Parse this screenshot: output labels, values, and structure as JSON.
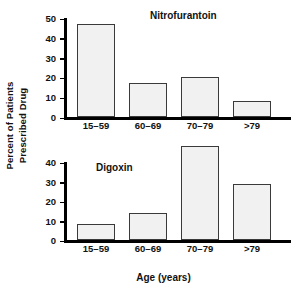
{
  "figure": {
    "ylabel_line1": "Percent of Patients",
    "ylabel_line2": "Prescribed Drug",
    "xaxis_title": "Age (years)",
    "bar_fill": "#f1f1f1",
    "bar_stroke": "#3a3a3a",
    "axis_color": "#000000"
  },
  "chart_data": [
    {
      "type": "bar",
      "title": "Nitrofurantoin",
      "categories": [
        "15–59",
        "60–69",
        "70–79",
        ">79"
      ],
      "values": [
        47,
        17,
        20,
        8
      ],
      "xlabel": "Age (years)",
      "ylabel": "Percent of Patients Prescribed Drug",
      "ylim": [
        0,
        50
      ],
      "yticks": [
        0,
        10,
        20,
        30,
        40,
        50
      ],
      "ytick_labels": [
        "0",
        "10",
        "20",
        "30",
        "40",
        "50"
      ],
      "grid": false,
      "legend": "none"
    },
    {
      "type": "bar",
      "title": "Digoxin",
      "categories": [
        "15–59",
        "60–69",
        "70–79",
        ">79"
      ],
      "values": [
        8,
        14,
        48,
        28.5
      ],
      "xlabel": "Age (years)",
      "ylabel": "Percent of Patients Prescribed Drug",
      "ylim": [
        0,
        40
      ],
      "yticks": [
        0,
        10,
        20,
        30,
        40
      ],
      "ytick_labels": [
        "0",
        "10",
        "20",
        "30",
        "40"
      ],
      "grid": false,
      "legend": "none",
      "note": "bar for 70-79 extends above the plotted axis maximum"
    }
  ]
}
